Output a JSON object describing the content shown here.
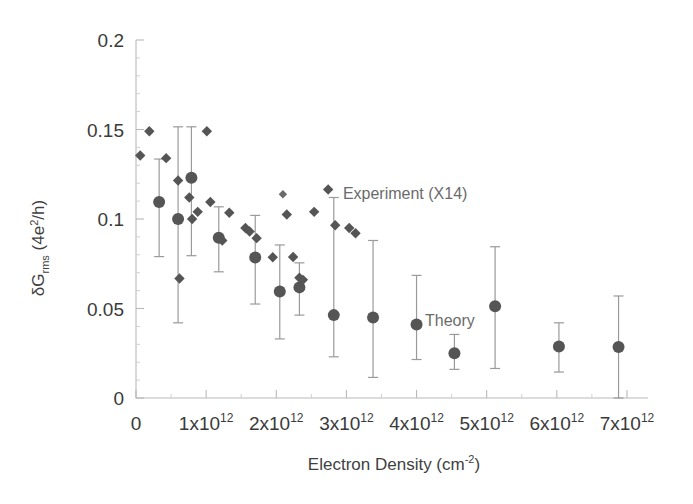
{
  "chart_data": {
    "type": "scatter",
    "title": "",
    "xlabel": "Electron Density (cm⁻²)",
    "ylabel": "δG_rms (4e²/h)",
    "xlim": [
      0,
      7300000000000
    ],
    "ylim": [
      0,
      0.2
    ],
    "xticks": [
      0,
      1000000000000,
      2000000000000,
      3000000000000,
      4000000000000,
      5000000000000,
      6000000000000,
      7000000000000
    ],
    "xticklabels": [
      "0",
      "1x10",
      "2x10",
      "3x10",
      "4x10",
      "5x10",
      "6x10",
      "7x10"
    ],
    "xtick_exponent": "12",
    "yticks": [
      0,
      0.05,
      0.1,
      0.15,
      0.2
    ],
    "yticklabels": [
      "0",
      "0.05",
      "0.1",
      "0.15",
      "0.2"
    ],
    "grid": false,
    "legend_position": "inside",
    "series": [
      {
        "name": "Experiment (X14)",
        "marker": "diamond",
        "color": "#555555",
        "points": [
          {
            "x": 60000000000,
            "y": 0.1355
          },
          {
            "x": 190000000000,
            "y": 0.149
          },
          {
            "x": 430000000000,
            "y": 0.134
          },
          {
            "x": 600000000000,
            "y": 0.1215
          },
          {
            "x": 620000000000,
            "y": 0.0668
          },
          {
            "x": 760000000000,
            "y": 0.112
          },
          {
            "x": 800000000000,
            "y": 0.1
          },
          {
            "x": 880000000000,
            "y": 0.104
          },
          {
            "x": 1010000000000,
            "y": 0.149
          },
          {
            "x": 1060000000000,
            "y": 0.1095
          },
          {
            "x": 1230000000000,
            "y": 0.088
          },
          {
            "x": 1330000000000,
            "y": 0.1035
          },
          {
            "x": 1560000000000,
            "y": 0.095
          },
          {
            "x": 1620000000000,
            "y": 0.093
          },
          {
            "x": 1720000000000,
            "y": 0.0893
          },
          {
            "x": 1950000000000,
            "y": 0.0786
          },
          {
            "x": 2150000000000,
            "y": 0.1025
          },
          {
            "x": 2240000000000,
            "y": 0.0788
          },
          {
            "x": 2330000000000,
            "y": 0.0672
          },
          {
            "x": 2380000000000,
            "y": 0.066
          },
          {
            "x": 2540000000000,
            "y": 0.104
          },
          {
            "x": 2740000000000,
            "y": 0.1165
          },
          {
            "x": 2840000000000,
            "y": 0.0965
          },
          {
            "x": 3040000000000,
            "y": 0.095
          },
          {
            "x": 3130000000000,
            "y": 0.092
          }
        ]
      },
      {
        "name": "Theory",
        "marker": "circle",
        "color": "#555555",
        "points": [
          {
            "x": 330000000000,
            "y": 0.1095,
            "yerr_low": 0.079,
            "yerr_high": 0.1335
          },
          {
            "x": 600000000000,
            "y": 0.1,
            "yerr_low": 0.042,
            "yerr_high": 0.1515
          },
          {
            "x": 790000000000,
            "y": 0.123,
            "yerr_low": 0.0795,
            "yerr_high": 0.1515
          },
          {
            "x": 1180000000000,
            "y": 0.0895,
            "yerr_low": 0.0705,
            "yerr_high": 0.1068
          },
          {
            "x": 1700000000000,
            "y": 0.0785,
            "yerr_low": 0.0525,
            "yerr_high": 0.102
          },
          {
            "x": 2050000000000,
            "y": 0.0595,
            "yerr_low": 0.033,
            "yerr_high": 0.0855
          },
          {
            "x": 2330000000000,
            "y": 0.0618,
            "yerr_low": 0.0463,
            "yerr_high": 0.0755
          },
          {
            "x": 2820000000000,
            "y": 0.0463,
            "yerr_low": 0.023,
            "yerr_high": 0.112
          },
          {
            "x": 3380000000000,
            "y": 0.045,
            "yerr_low": 0.0115,
            "yerr_high": 0.088
          },
          {
            "x": 4000000000000,
            "y": 0.041,
            "yerr_low": 0.0215,
            "yerr_high": 0.0685
          },
          {
            "x": 4540000000000,
            "y": 0.025,
            "yerr_low": 0.016,
            "yerr_high": 0.0355
          },
          {
            "x": 5120000000000,
            "y": 0.0512,
            "yerr_low": 0.0165,
            "yerr_high": 0.0845
          },
          {
            "x": 6030000000000,
            "y": 0.0288,
            "yerr_low": 0.0145,
            "yerr_high": 0.042
          },
          {
            "x": 6880000000000,
            "y": 0.0285,
            "yerr_low": 0.0,
            "yerr_high": 0.057
          }
        ]
      }
    ],
    "annotations": [
      {
        "text": "Experiment (X14)",
        "x": 2950000000000,
        "y": 0.111,
        "marker": "diamond"
      },
      {
        "text": "Theory",
        "x": 4120000000000,
        "y": 0.04,
        "marker": "none"
      }
    ]
  },
  "axes": {
    "x_title": "Electron Density (cm",
    "x_title_sup": "-2",
    "x_title_end": ")",
    "y_title_main": "δG",
    "y_title_sub": "rms",
    "y_title_unit_open": "(4e",
    "y_title_unit_sup": "2",
    "y_title_unit_close": "/h)"
  },
  "legend": {
    "experiment_label": "Experiment (X14)",
    "theory_label": "Theory"
  },
  "colors": {
    "marker": "#555555",
    "errorbar": "#9a9a9a",
    "axis": "#b9b9b9",
    "text": "#3a3a3a",
    "annotation_text": "#6b6b6b",
    "background": "#ffffff"
  }
}
